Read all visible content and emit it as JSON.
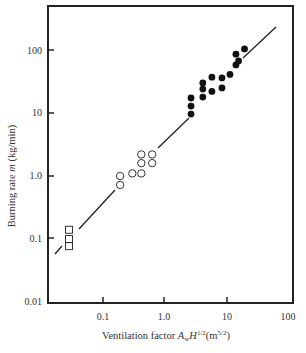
{
  "chart_data": {
    "type": "scatter",
    "title": "",
    "xlabel": "Ventilation factor A_w H^1/2 (m^5/2)",
    "ylabel": "Burning rate m (kg/min)",
    "xscale": "log",
    "yscale": "log",
    "xlim": [
      0.01,
      100
    ],
    "ylim": [
      0.01,
      1000
    ],
    "x_ticks": [
      "0.1",
      "1.0",
      "10",
      "100"
    ],
    "y_ticks": [
      "0.01",
      "0.1",
      "1.0",
      "10",
      "100"
    ],
    "grid": false,
    "legend": null,
    "series": [
      {
        "name": "squares",
        "marker": "open-square",
        "points": [
          [
            0.028,
            0.14
          ],
          [
            0.028,
            0.1
          ],
          [
            0.028,
            0.077
          ]
        ]
      },
      {
        "name": "open-circles",
        "marker": "open-circle",
        "points": [
          [
            0.19,
            1.0
          ],
          [
            0.19,
            0.72
          ],
          [
            0.3,
            1.1
          ],
          [
            0.42,
            1.1
          ],
          [
            0.42,
            1.6
          ],
          [
            0.42,
            2.2
          ],
          [
            0.63,
            1.6
          ],
          [
            0.63,
            2.2
          ]
        ]
      },
      {
        "name": "filled-circles",
        "marker": "filled-circle",
        "points": [
          [
            2.7,
            9.6
          ],
          [
            2.7,
            12.9
          ],
          [
            2.7,
            17.3
          ],
          [
            4.2,
            17.9
          ],
          [
            4.2,
            24
          ],
          [
            4.2,
            30
          ],
          [
            5.9,
            22
          ],
          [
            5.9,
            37
          ],
          [
            8.6,
            25
          ],
          [
            8.6,
            36
          ],
          [
            11.6,
            41
          ],
          [
            14.5,
            58
          ],
          [
            14.5,
            86
          ],
          [
            16,
            67
          ],
          [
            20,
            104
          ]
        ]
      },
      {
        "name": "fit-line",
        "type": "line",
        "points": [
          [
            0.015,
            0.055
          ],
          [
            60,
            330
          ]
        ]
      }
    ]
  },
  "labels": {
    "x_axis": "Ventilation factor",
    "x_axis_sym": "A",
    "x_axis_sub": "w",
    "x_axis_sym2": "H",
    "x_axis_sup": "1/2",
    "x_axis_unit_open": "(m",
    "x_axis_unit_sup": "5/2",
    "x_axis_unit_close": ")",
    "y_axis": "Burning rate",
    "y_axis_sym": "m",
    "y_axis_unit": "(kg/min)"
  },
  "ticks": {
    "x": [
      "0.1",
      "1.0",
      "10",
      "100"
    ],
    "y": [
      "0.01",
      "0.1",
      "1.0",
      "10",
      "100"
    ]
  }
}
